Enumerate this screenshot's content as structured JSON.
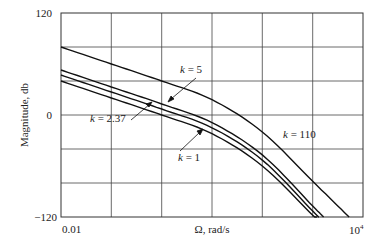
{
  "chart_data": {
    "type": "line",
    "title": "",
    "xlabel": "Ω, rad/s",
    "ylabel": "Magnitude, db",
    "xscale": "log",
    "xlim": [
      0.01,
      10000
    ],
    "ylim": [
      -120,
      120
    ],
    "grid": true,
    "x_tick_labels": [
      "0.01",
      "10⁴"
    ],
    "y_tick_labels": [
      "120",
      "0",
      "−120"
    ],
    "x": [
      0.01,
      0.1,
      1,
      10,
      100,
      1000,
      10000
    ],
    "series": [
      {
        "name": "k = 1",
        "values": [
          40,
          20,
          0,
          -22,
          -60,
          -118,
          null
        ]
      },
      {
        "name": "k = 2.37",
        "values": [
          47,
          27,
          7,
          -15,
          -53,
          -113,
          null
        ]
      },
      {
        "name": "k = 5",
        "values": [
          53,
          33,
          13,
          -9,
          -47,
          -107,
          null
        ]
      },
      {
        "name": "k = 110",
        "values": [
          80,
          60,
          40,
          18,
          -20,
          -78,
          null
        ]
      }
    ],
    "annotations": [
      {
        "text": "k = 5",
        "target_series": "k = 5"
      },
      {
        "text": "k = 2.37",
        "target_series": "k = 2.37"
      },
      {
        "text": "k = 1",
        "target_series": "k = 1"
      },
      {
        "text": "k = 110",
        "target_series": "k = 110"
      }
    ]
  },
  "labels": {
    "y_top": "120",
    "y_zero": "0",
    "y_bottom": "−120",
    "x_left": "0.01",
    "x_right_base": "10",
    "x_right_exp": "4",
    "xlabel": "Ω, rad/s",
    "ylabel": "Magnitude, db",
    "k5": "5",
    "k237": "2.37",
    "k1": "1",
    "k110": "110",
    "k_symbol": "k",
    "eq": " = "
  }
}
